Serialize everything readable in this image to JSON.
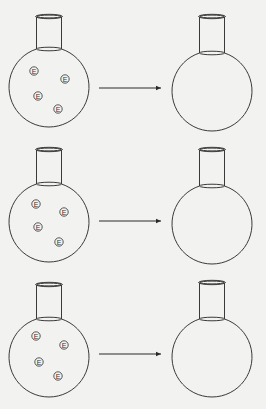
{
  "diagram": {
    "particle_label": "E",
    "rows": [
      {
        "id": "row-1",
        "left_flask": {
          "cx": 49,
          "cy": 87,
          "r": 40,
          "neck_top": 15,
          "particles": [
            [
              34,
              71
            ],
            [
              65,
              79
            ],
            [
              38,
              96
            ],
            [
              58,
              109
            ]
          ]
        },
        "arrow": {
          "x1": 99,
          "x2": 161,
          "y": 88
        },
        "right_flask": {
          "cx": 212,
          "cy": 91,
          "r": 40,
          "neck_top": 15,
          "particles": []
        }
      },
      {
        "id": "row-2",
        "left_flask": {
          "cx": 49,
          "cy": 222,
          "r": 40,
          "neck_top": 148,
          "particles": [
            [
              36,
              204
            ],
            [
              64,
              212
            ],
            [
              38,
              227
            ],
            [
              59,
              242
            ]
          ]
        },
        "arrow": {
          "x1": 99,
          "x2": 161,
          "y": 221
        },
        "right_flask": {
          "cx": 212,
          "cy": 224,
          "r": 40,
          "neck_top": 148,
          "particles": []
        }
      },
      {
        "id": "row-3",
        "left_flask": {
          "cx": 49,
          "cy": 357,
          "r": 40,
          "neck_top": 283,
          "particles": [
            [
              36,
              336
            ],
            [
              64,
              345
            ],
            [
              39,
              362
            ],
            [
              58,
              376
            ]
          ]
        },
        "arrow": {
          "x1": 99,
          "x2": 161,
          "y": 354
        },
        "right_flask": {
          "cx": 212,
          "cy": 357,
          "r": 40,
          "neck_top": 281,
          "particles": []
        }
      }
    ]
  }
}
